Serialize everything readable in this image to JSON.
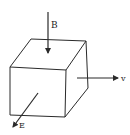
{
  "diagram": {
    "type": "cube-vector-diagram",
    "colors": {
      "background": "#ffffff",
      "stroke": "#2a2a2a",
      "text": "#222222"
    },
    "cube": {
      "front_face": [
        [
          10,
          67
        ],
        [
          66,
          70
        ],
        [
          65,
          117
        ],
        [
          10,
          115
        ]
      ],
      "back_face": [
        [
          31,
          39
        ],
        [
          86,
          41
        ],
        [
          88,
          88
        ]
      ]
    },
    "vectors": [
      {
        "id": "B",
        "label": "B",
        "from": [
          48,
          12
        ],
        "to": [
          48,
          53
        ],
        "label_pos": [
          51,
          28
        ]
      },
      {
        "id": "v",
        "label": "v",
        "from": [
          77,
          78
        ],
        "to": [
          118,
          78
        ],
        "label_pos": [
          121,
          81
        ]
      },
      {
        "id": "E",
        "label": "E",
        "from": [
          38,
          93
        ],
        "to": [
          13,
          127
        ],
        "label_pos": [
          19,
          128
        ]
      }
    ]
  }
}
